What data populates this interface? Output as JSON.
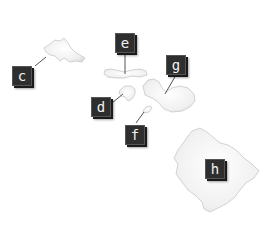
{
  "diagram": {
    "colors": {
      "island_fill": "#efefef",
      "island_stroke": "#c8c8c8",
      "label_bg": "#2e2e2e",
      "label_text": "#f2f2f2",
      "leader_line": "#555555"
    },
    "labels": [
      {
        "id": "c",
        "text": "c"
      },
      {
        "id": "e",
        "text": "e"
      },
      {
        "id": "g",
        "text": "g"
      },
      {
        "id": "d",
        "text": "d"
      },
      {
        "id": "f",
        "text": "f"
      },
      {
        "id": "h",
        "text": "h"
      }
    ]
  }
}
